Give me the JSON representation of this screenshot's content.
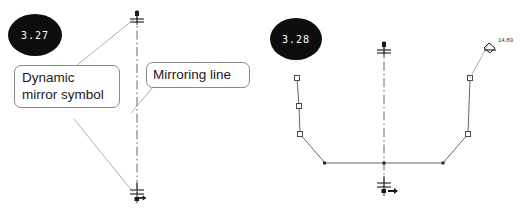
{
  "page": {
    "background": "#ffffff",
    "width": 525,
    "height": 213
  },
  "figures": [
    {
      "id": "fig-3-27",
      "badge": {
        "label": "3.27",
        "fill": "#0d0d0d",
        "text_color": "#ffffff",
        "cx": 35,
        "cy": 35,
        "rx": 27,
        "ry": 21
      },
      "mirroring_line": {
        "name": "mirroring-line",
        "x": 137,
        "y_top": 14,
        "y_bottom": 198,
        "style": "dash-dot",
        "color": "#555555"
      },
      "mirror_symbols": [
        {
          "name": "dynamic-mirror-symbol-top",
          "x": 137,
          "y": 17
        },
        {
          "name": "dynamic-mirror-symbol-bottom",
          "x": 137,
          "y": 194
        }
      ],
      "callouts": [
        {
          "id": "callout-dynamic-mirror",
          "name": "callout-dynamic-mirror-symbol",
          "text": "Dynamic\nmirror symbol",
          "border_color": "#8a8a8a"
        },
        {
          "id": "callout-mirroring-line",
          "name": "callout-mirroring-line",
          "text": "Mirroring line",
          "border_color": "#8a8a8a"
        }
      ],
      "leaders": [
        {
          "name": "leader-dynamic-mirror-top",
          "x1": 76,
          "y1": 66,
          "x2": 133,
          "y2": 20
        },
        {
          "name": "leader-dynamic-mirror-bottom",
          "x1": 74,
          "y1": 119,
          "x2": 133,
          "y2": 192
        },
        {
          "name": "leader-mirroring-line",
          "x1": 153,
          "y1": 87,
          "x2": 131,
          "y2": 113
        }
      ]
    },
    {
      "id": "fig-3-28",
      "badge": {
        "label": "3.28",
        "fill": "#0d0d0d",
        "text_color": "#ffffff",
        "cx": 296,
        "cy": 39,
        "rx": 26,
        "ry": 21
      },
      "mirroring_line": {
        "name": "mirroring-line",
        "x": 384,
        "y_top": 45,
        "y_bottom": 190,
        "style": "dash-dot",
        "color": "#555555"
      },
      "mirror_symbols": [
        {
          "name": "dynamic-mirror-symbol-top",
          "x": 384,
          "y": 48
        },
        {
          "name": "dynamic-mirror-symbol-bottom",
          "x": 384,
          "y": 186
        }
      ],
      "profile": {
        "name": "mirrored-sketch-profile",
        "stroke": "#555555",
        "points": [
          {
            "x": 297,
            "y": 78,
            "handle": true
          },
          {
            "x": 299,
            "y": 106,
            "handle": true
          },
          {
            "x": 300,
            "y": 134,
            "handle": true
          },
          {
            "x": 325,
            "y": 163,
            "handle": false
          },
          {
            "x": 384,
            "y": 163,
            "handle": false
          },
          {
            "x": 443,
            "y": 163,
            "handle": false
          },
          {
            "x": 468,
            "y": 134,
            "handle": true
          },
          {
            "x": 470,
            "y": 78,
            "handle": true
          }
        ]
      },
      "dimension": {
        "name": "angle-dimension",
        "value": "14,89",
        "text_x": 498,
        "text_y": 42,
        "leader": {
          "x1": 470,
          "y1": 78,
          "x2": 488,
          "y2": 44
        }
      }
    }
  ]
}
